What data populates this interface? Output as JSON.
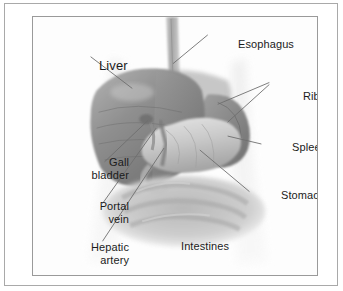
{
  "figure": {
    "type": "anatomical-illustration",
    "style": "grayscale-medical-drawing",
    "colors": {
      "frame_border": "#a9a9a9",
      "panel_border": "#9a9a9a",
      "background": "#ffffff",
      "label_text": "#1b1b1b",
      "leader_line": "#6e6e6e",
      "liver_dark": "#7c7c7c",
      "liver_mid": "#9a9a9a",
      "stomach_light": "#c9c9c9",
      "spleen": "#8d8d8d",
      "intestines": "#bdbdbd",
      "body_outline": "#f0f0f0"
    },
    "labels": [
      {
        "id": "esophagus",
        "text": "Esophagus",
        "lines": 1,
        "has_leader": true,
        "leader_count": 1,
        "align": "left"
      },
      {
        "id": "liver",
        "text": "Liver",
        "lines": 1,
        "has_leader": true,
        "leader_count": 1,
        "align": "left"
      },
      {
        "id": "ribs",
        "text": "Ribs",
        "lines": 1,
        "has_leader": true,
        "leader_count": 2,
        "align": "left"
      },
      {
        "id": "spleen",
        "text": "Spleen",
        "lines": 1,
        "has_leader": true,
        "leader_count": 1,
        "align": "left"
      },
      {
        "id": "stomach",
        "text": "Stomach",
        "lines": 1,
        "has_leader": true,
        "leader_count": 1,
        "align": "left"
      },
      {
        "id": "gall",
        "text": "Gall\nbladder",
        "lines": 2,
        "has_leader": true,
        "leader_count": 1,
        "align": "right"
      },
      {
        "id": "portal",
        "text": "Portal\nvein",
        "lines": 2,
        "has_leader": true,
        "leader_count": 1,
        "align": "right"
      },
      {
        "id": "hepatic",
        "text": "Hepatic\nartery",
        "lines": 2,
        "has_leader": true,
        "leader_count": 1,
        "align": "right"
      },
      {
        "id": "intestines",
        "text": "Intestines",
        "lines": 1,
        "has_leader": false,
        "leader_count": 0,
        "align": "left"
      }
    ],
    "label_text": {
      "esophagus": "Esophagus",
      "liver": "Liver",
      "ribs": "Ribs",
      "spleen": "Spleen",
      "stomach": "Stomach",
      "gall_bladder": "Gall\nbladder",
      "portal_vein": "Portal\nvein",
      "hepatic_artery": "Hepatic\nartery",
      "intestines": "Intestines"
    }
  }
}
